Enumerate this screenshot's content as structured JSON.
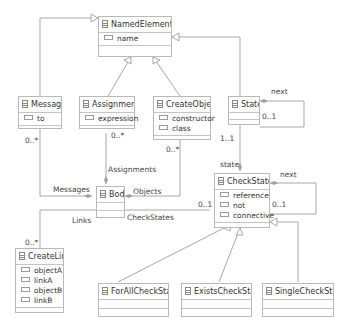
{
  "classes": {
    "named_element": {
      "name": "NamedElement",
      "attrs": [
        "name"
      ]
    },
    "message": {
      "name": "Message",
      "attrs": [
        "to"
      ]
    },
    "assignment": {
      "name": "Assignment",
      "attrs": [
        "expression"
      ]
    },
    "create_object": {
      "name": "CreateObject",
      "attrs": [
        "constructor",
        "class"
      ]
    },
    "state": {
      "name": "State",
      "attrs": []
    },
    "body": {
      "name": "Body",
      "attrs": []
    },
    "check_state": {
      "name": "CheckState",
      "attrs": [
        "reference",
        "not",
        "connective"
      ]
    },
    "create_link": {
      "name": "CreateLink",
      "attrs": [
        "objectA",
        "linkA",
        "objectB",
        "linkB"
      ]
    },
    "for_all_check_state": {
      "name": "ForAllCheckState",
      "attrs": []
    },
    "exists_check_state": {
      "name": "ExistsCheckState",
      "attrs": []
    },
    "single_check_state": {
      "name": "SingleCheckState",
      "attrs": []
    }
  },
  "labels": {
    "state_next": "next",
    "state_next_mult": "0..1",
    "message_mult": "0..*",
    "assignment_mult": "0..*",
    "create_object_mult": "0..*",
    "state_mult": "1..1",
    "state_role": "state",
    "assignments": "Assignments",
    "messages": "Messages",
    "objects": "Objects",
    "links": "Links",
    "check_states": "CheckStates",
    "check_states_mult": "0..1",
    "check_state_next": "next",
    "check_state_next_mult": "0..1",
    "create_link_mult": "0..*"
  }
}
